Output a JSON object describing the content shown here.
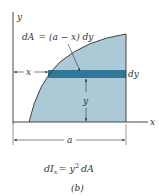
{
  "figure": {
    "labels": {
      "y_axis": "y",
      "x_axis": "x",
      "element_eq_lhs": "dA",
      "element_eq_rhs": "= (a − x) dy",
      "x_dim": "x",
      "dy": "dy",
      "y_dim": "y",
      "a_dim": "a",
      "moment_eq_lhs": "dI",
      "moment_eq_sub": "x",
      "moment_eq_rhs1": "= y",
      "moment_eq_sup": "2",
      "moment_eq_rhs2": "dA",
      "caption": "(b)"
    },
    "colors": {
      "area_fill": "#abc9d6",
      "strip_fill": "#2e7898",
      "line": "#333333"
    }
  }
}
